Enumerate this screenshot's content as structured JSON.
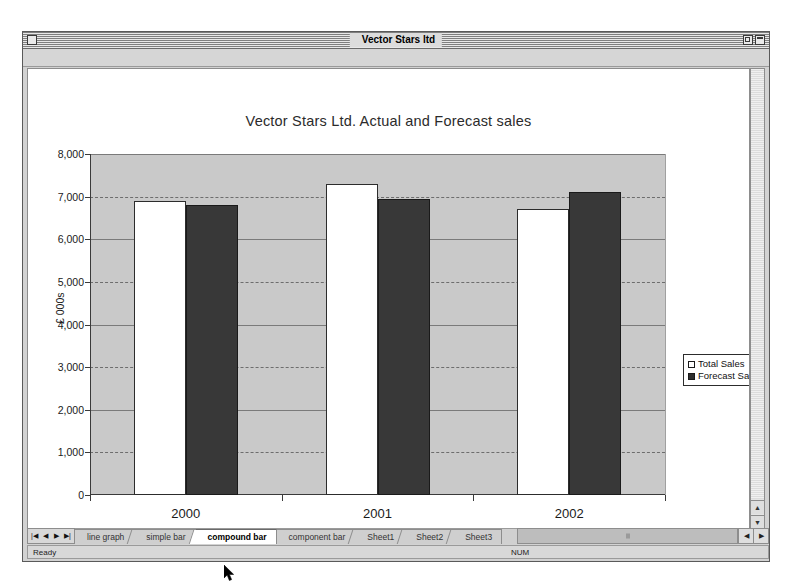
{
  "window": {
    "title": "Vector Stars ltd",
    "close_box": "close-box",
    "zoom_box": "zoom-box",
    "collapse_box": "collapse-box"
  },
  "chart_data": {
    "type": "bar",
    "title": "Vector Stars Ltd. Actual and Forecast sales",
    "categories": [
      "2000",
      "2001",
      "2002"
    ],
    "series": [
      {
        "name": "Total Sales",
        "values": [
          6900,
          7300,
          6700
        ],
        "color": "#ffffff"
      },
      {
        "name": "Forecast Sales",
        "values": [
          6800,
          6950,
          7100
        ],
        "color": "#383838"
      }
    ],
    "xlabel": "",
    "ylabel": "£ 000s",
    "ylim": [
      0,
      8000
    ],
    "yticks": [
      0,
      1000,
      2000,
      3000,
      4000,
      5000,
      6000,
      7000,
      8000
    ],
    "ytick_labels": [
      "0",
      "1,000",
      "2,000",
      "3,000",
      "4,000",
      "5,000",
      "6,000",
      "7,000",
      "8,000"
    ],
    "grid": true,
    "legend_position": "right",
    "plot_background": "#c9c9c9"
  },
  "tabs": {
    "nav": {
      "first": "|◀",
      "prev": "◀",
      "next": "▶",
      "last": "▶|"
    },
    "items": [
      {
        "label": "line graph",
        "active": false
      },
      {
        "label": "simple bar",
        "active": false
      },
      {
        "label": "compound bar",
        "active": true
      },
      {
        "label": "component bar",
        "active": false
      },
      {
        "label": "Sheet1",
        "active": false
      },
      {
        "label": "Sheet2",
        "active": false
      },
      {
        "label": "Sheet3",
        "active": false
      }
    ]
  },
  "scrollbars": {
    "v_up": "▲",
    "v_down": "▼",
    "h_left": "◀",
    "h_right": "▶"
  },
  "statusbar": {
    "message": "Ready",
    "num_indicator": "NUM"
  }
}
